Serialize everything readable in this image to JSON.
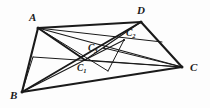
{
  "figure": {
    "width": 210,
    "height": 108,
    "background_color": "#fdfdfd",
    "stroke_color": "#1a1a1a",
    "style": "hand-drawn line diagram, black ink on white"
  },
  "points": [
    {
      "id": "A",
      "label": "A",
      "sub": "",
      "x": 38,
      "y": 28,
      "label_x": 29,
      "label_y": 12,
      "kind": "major"
    },
    {
      "id": "B",
      "label": "B",
      "sub": "",
      "x": 22,
      "y": 92,
      "label_x": 10,
      "label_y": 90,
      "kind": "major"
    },
    {
      "id": "C",
      "label": "C",
      "sub": "",
      "x": 182,
      "y": 67,
      "label_x": 190,
      "label_y": 62,
      "kind": "major"
    },
    {
      "id": "D",
      "label": "D",
      "sub": "",
      "x": 141,
      "y": 22,
      "label_x": 137,
      "label_y": 5,
      "kind": "major"
    },
    {
      "id": "C1",
      "label": "C",
      "sub": "1",
      "x": 85,
      "y": 60,
      "label_x": 77,
      "label_y": 64,
      "kind": "minor"
    },
    {
      "id": "C2",
      "label": "C",
      "sub": "2",
      "x": 124,
      "y": 40,
      "label_x": 126,
      "label_y": 29,
      "kind": "minor"
    },
    {
      "id": "C3",
      "label": "C",
      "sub": "3",
      "x": 104,
      "y": 48,
      "label_x": 88,
      "label_y": 44,
      "kind": "minor"
    },
    {
      "id": "P",
      "label": "",
      "sub": "",
      "x": 33,
      "y": 57,
      "label_x": 0,
      "label_y": 0,
      "kind": "anchor"
    },
    {
      "id": "Q",
      "label": "",
      "sub": "",
      "x": 108,
      "y": 71,
      "label_x": 0,
      "label_y": 0,
      "kind": "anchor"
    },
    {
      "id": "R",
      "label": "",
      "sub": "",
      "x": 162,
      "y": 42,
      "label_x": 0,
      "label_y": 0,
      "kind": "anchor"
    }
  ],
  "segments": [
    {
      "id": "side-AD",
      "from": "A",
      "to": "D",
      "weight": 2.1
    },
    {
      "id": "side-DC",
      "from": "D",
      "to": "C",
      "weight": 2.1
    },
    {
      "id": "side-BC",
      "from": "B",
      "to": "C",
      "weight": 2.1
    },
    {
      "id": "side-AB",
      "from": "A",
      "to": "B",
      "weight": 2.1
    },
    {
      "id": "diag-A-C",
      "from": "A",
      "to": "C",
      "weight": 1.2
    },
    {
      "id": "diag-B-D",
      "from": "B",
      "to": "D",
      "weight": 1.9
    },
    {
      "id": "cev-A-C1",
      "from": "A",
      "to": "C1",
      "weight": 2.0
    },
    {
      "id": "cev-A-Q",
      "from": "A",
      "to": "Q",
      "weight": 1.0
    },
    {
      "id": "cev-A-R",
      "from": "A",
      "to": "R",
      "weight": 1.0
    },
    {
      "id": "cev-B-C2",
      "from": "B",
      "to": "C2",
      "weight": 1.1
    },
    {
      "id": "cev-C-C1",
      "from": "C",
      "to": "C1",
      "weight": 1.1
    },
    {
      "id": "cev-C-C3",
      "from": "C",
      "to": "C3",
      "weight": 1.0
    },
    {
      "id": "cev-C-P",
      "from": "C",
      "to": "P",
      "weight": 1.0
    },
    {
      "id": "cev-D-C1",
      "from": "D",
      "to": "C1",
      "weight": 1.2
    },
    {
      "id": "cev-Q-C2",
      "from": "Q",
      "to": "C2",
      "weight": 1.0
    },
    {
      "id": "seg-P-B",
      "from": "P",
      "to": "B",
      "weight": 1.0
    }
  ]
}
